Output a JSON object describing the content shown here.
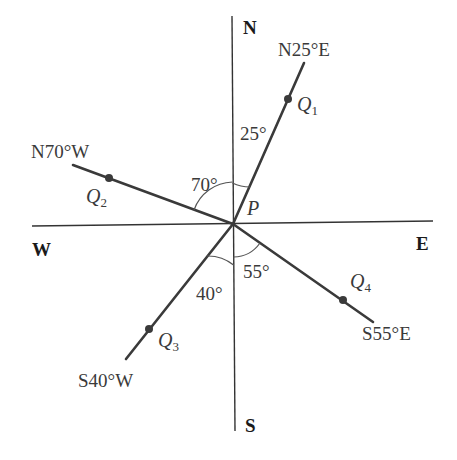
{
  "diagram": {
    "type": "compass-bearings",
    "center_point": "P",
    "directions": {
      "north": "N",
      "south": "S",
      "east": "E",
      "west": "W"
    },
    "bearings": [
      {
        "point": "Q",
        "subscript": "1",
        "bearing": "N25°E",
        "angle_label": "25°"
      },
      {
        "point": "Q",
        "subscript": "2",
        "bearing": "N70°W",
        "angle_label": "70°"
      },
      {
        "point": "Q",
        "subscript": "3",
        "bearing": "S40°W",
        "angle_label": "40°"
      },
      {
        "point": "Q",
        "subscript": "4",
        "bearing": "S55°E",
        "angle_label": "55°"
      }
    ]
  },
  "colors": {
    "line": "#3a3a3a",
    "text": "#3a3a3a",
    "background": "#ffffff"
  }
}
